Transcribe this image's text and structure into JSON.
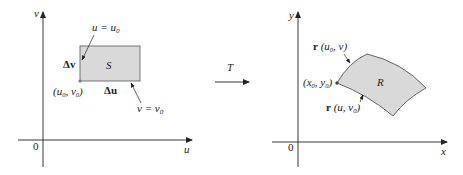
{
  "left_panel": {
    "axis_x_label": "u",
    "axis_y_label": "v",
    "origin_label": "0",
    "region_label": "S",
    "line_u_label": "u = u",
    "line_u_sub": "0",
    "line_v_label": "v = v",
    "line_v_sub": "0",
    "delta_v": "Δv",
    "delta_u": "Δu",
    "corner_point": "(u",
    "corner_point_sub1": "0",
    "corner_point_mid": ", v",
    "corner_point_sub2": "0",
    "corner_point_end": ")"
  },
  "transform": {
    "label": "T"
  },
  "right_panel": {
    "axis_x_label": "x",
    "axis_y_label": "y",
    "origin_label": "0",
    "region_label": "R",
    "curve_top_bold": "r",
    "curve_top_args": " (u",
    "curve_top_sub": "0",
    "curve_top_end": ", v)",
    "curve_bottom_bold": "r",
    "curve_bottom_args": " (u, v",
    "curve_bottom_sub": "0",
    "curve_bottom_end": ")",
    "point_label": "(x",
    "point_sub1": "0",
    "point_mid": ", y",
    "point_sub2": "0",
    "point_end": ")"
  },
  "colors": {
    "region_fill": "#d9d9d9",
    "stroke": "#333333",
    "axis": "#222222"
  }
}
